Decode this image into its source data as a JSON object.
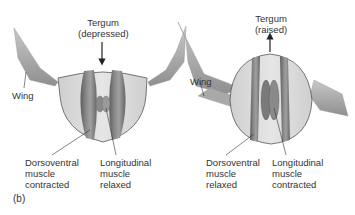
{
  "figure": {
    "panel_label": "(b)",
    "colors": {
      "wing": "#a9a9a9",
      "wing_dark": "#8c8c8c",
      "thorax": "#dcdcdc",
      "thorax_outline": "#555555",
      "muscle": "#7a7a7a",
      "muscle_dark": "#5e5e5e",
      "muscle_light": "#9a9a9a",
      "leader_line": "#333333",
      "text": "#333333"
    },
    "left": {
      "tergum_line1": "Tergum",
      "tergum_line2": "(depressed)",
      "arrow_direction": "down",
      "wing_label": "Wing",
      "dv_line1": "Dorsoventral",
      "dv_line2": "muscle",
      "dv_line3": "contracted",
      "long_line1": "Longitudinal",
      "long_line2": "muscle",
      "long_line3": "relaxed"
    },
    "right": {
      "tergum_line1": "Tergum",
      "tergum_line2": "(raised)",
      "arrow_direction": "up",
      "wing_label": "Wing",
      "dv_line1": "Dorsoventral",
      "dv_line2": "muscle",
      "dv_line3": "relaxed",
      "long_line1": "Longitudinal",
      "long_line2": "muscle",
      "long_line3": "contracted"
    }
  }
}
